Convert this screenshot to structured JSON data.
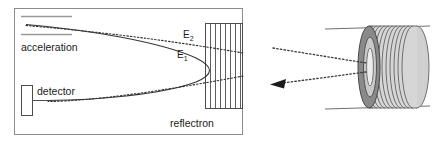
{
  "figure": {
    "name": "reflectron-time-of-flight-diagram",
    "labels": {
      "acceleration": "acceleration",
      "detector": "detector",
      "reflectron": "reflectron",
      "energy_low": "E",
      "energy_low_sub": "1",
      "energy_high": "E",
      "energy_high_sub": "2"
    }
  },
  "schematic": {
    "panel": {
      "border_color": "#8c8c8c",
      "background": "#ffffff"
    },
    "acceleration_region": {
      "label": "acceleration",
      "plate_color": "#9a9a9a",
      "plate_count": 2
    },
    "detector": {
      "label": "detector",
      "outline_color": "#4d4d4d",
      "lead_color": "#4d4d4d"
    },
    "reflectron_box": {
      "label": "reflectron",
      "grid_line_count": 7,
      "outline_color": "#4d4d4d",
      "grid_color": "#4d4d4d"
    },
    "trajectories": [
      {
        "name": "low-energy-ion-path",
        "label": "E",
        "subscript": "1",
        "style": "solid",
        "color": "#333333",
        "description": "solid curve turning early inside the reflectron"
      },
      {
        "name": "high-energy-ion-path",
        "label": "E",
        "subscript": "2",
        "style": "dotted",
        "color": "#333333",
        "description": "dotted curve penetrating deeper into the reflectron"
      }
    ]
  },
  "illustration": {
    "name": "reflectron-cylinder-3d",
    "tube_wall_color": "#6f6f6f",
    "ring_stack": {
      "front_ring_color": "#8a8a8a",
      "barrel_color": "#d6d6d6",
      "barrel_stripe_color": "#6f6f6f",
      "back_disc_color": "#d0d0d0",
      "aperture_color": "#ededed",
      "ring_count": 11
    },
    "arrows": [
      {
        "name": "incoming-ion-arrow",
        "style": "dotted",
        "direction": "into-reflectron",
        "color": "#3a3a3a",
        "arrowhead": false
      },
      {
        "name": "outgoing-ion-arrow",
        "style": "dotted",
        "direction": "out-of-reflectron",
        "color": "#3a3a3a",
        "arrowhead": true
      }
    ]
  }
}
